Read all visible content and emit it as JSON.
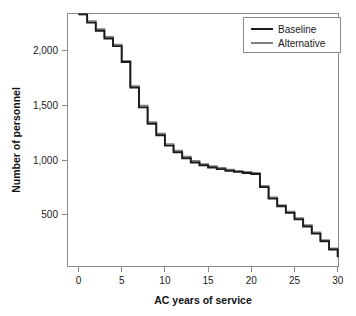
{
  "chart_data": {
    "type": "line",
    "title": "",
    "xlabel": "AC years of service",
    "ylabel": "Number of personnel",
    "xlim": [
      0,
      30
    ],
    "ylim": [
      0,
      2400
    ],
    "xticks": [
      0,
      5,
      10,
      15,
      20,
      25,
      30
    ],
    "xtick_labels": [
      "0",
      "5",
      "10",
      "15",
      "20",
      "25",
      "30"
    ],
    "yticks": [
      500,
      1000,
      1500,
      2000
    ],
    "ytick_labels": [
      "500",
      "1,000",
      "1,500",
      "2,000"
    ],
    "grid": false,
    "legend_position": "top-right",
    "step_style": "post",
    "x": [
      0,
      1,
      2,
      3,
      4,
      5,
      6,
      7,
      8,
      9,
      10,
      11,
      12,
      13,
      14,
      15,
      16,
      17,
      18,
      19,
      20,
      21,
      22,
      23,
      24,
      25,
      26,
      27,
      28,
      29,
      30
    ],
    "series": [
      {
        "name": "Baseline",
        "color": "#1b1b1b",
        "values": [
          2330,
          2255,
          2180,
          2110,
          2040,
          1895,
          1660,
          1480,
          1330,
          1225,
          1130,
          1070,
          1015,
          975,
          950,
          930,
          915,
          900,
          890,
          880,
          870,
          750,
          645,
          575,
          515,
          455,
          390,
          325,
          255,
          180,
          110
        ]
      },
      {
        "name": "Alternative",
        "color": "#808080",
        "values": [
          2330,
          2270,
          2195,
          2125,
          2055,
          1905,
          1675,
          1495,
          1345,
          1240,
          1145,
          1085,
          1030,
          990,
          962,
          942,
          926,
          911,
          900,
          890,
          880,
          762,
          657,
          587,
          527,
          467,
          402,
          337,
          266,
          191,
          120
        ]
      }
    ],
    "legend": [
      {
        "label": "Baseline",
        "color": "#1b1b1b"
      },
      {
        "label": "Alternative",
        "color": "#808080"
      }
    ]
  },
  "axes": {
    "x_title": "AC years of service",
    "y_title": "Number of personnel"
  },
  "legend": {
    "item0_label": "Baseline",
    "item1_label": "Alternative"
  },
  "xticks": {
    "t0": "0",
    "t1": "5",
    "t2": "10",
    "t3": "15",
    "t4": "20",
    "t5": "25",
    "t6": "30"
  },
  "yticks": {
    "t0": "500",
    "t1": "1,000",
    "t2": "1,500",
    "t3": "2,000"
  }
}
